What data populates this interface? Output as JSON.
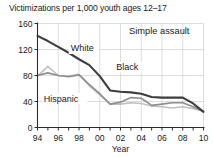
{
  "chart_data": {
    "type": "line",
    "title": "Victimizations per 1,000 youth ages 12–17",
    "annotation": "Simple assault",
    "xlabel": "Year",
    "ylabel": "",
    "x": [
      1994,
      1995,
      1996,
      1997,
      1998,
      1999,
      2000,
      2001,
      2002,
      2003,
      2004,
      2005,
      2006,
      2007,
      2008,
      2009,
      2010
    ],
    "x_tick_labels": [
      "94",
      "",
      "96",
      "",
      "98",
      "",
      "00",
      "",
      "02",
      "",
      "04",
      "",
      "06",
      "",
      "08",
      "",
      "10"
    ],
    "y_tick_labels": [
      "0",
      "40",
      "80",
      "120",
      "160"
    ],
    "y_ticks": [
      0,
      40,
      80,
      120,
      160
    ],
    "ylim": [
      0,
      160
    ],
    "xlim": [
      1994,
      2010
    ],
    "grid": true,
    "legend": "inline-labels",
    "series": [
      {
        "name": "White",
        "color": "#3d3d3d",
        "width": 2.1,
        "label_x": 1997.2,
        "label_y": 117,
        "values": [
          141,
          133,
          124,
          115,
          105,
          96,
          79,
          57,
          55,
          54,
          52,
          47,
          46,
          46,
          46,
          37,
          24
        ]
      },
      {
        "name": "Black",
        "color": "#8e8e8e",
        "width": 1.6,
        "label_x": 2001.6,
        "label_y": 88,
        "values": [
          80,
          84,
          80,
          78,
          81,
          66,
          52,
          36,
          39,
          46,
          45,
          34,
          36,
          38,
          38,
          32,
          25
        ]
      },
      {
        "name": "Hispanic",
        "color": "#c0c0c0",
        "width": 1.6,
        "label_x": 1994.6,
        "label_y": 40,
        "values": [
          79,
          94,
          80,
          79,
          82,
          64,
          50,
          36,
          36,
          38,
          37,
          33,
          32,
          30,
          32,
          29,
          25
        ]
      }
    ]
  }
}
